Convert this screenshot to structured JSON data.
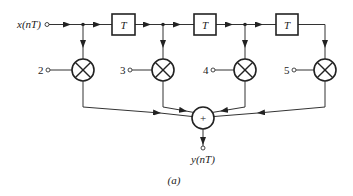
{
  "diagram": {
    "type": "FIR filter block diagram (transversal structure)",
    "input_label": "x(nT)",
    "output_label": "y(nT)",
    "caption": "(a)",
    "delay_label": "T",
    "delays": [
      "T",
      "T",
      "T"
    ],
    "coefficients": [
      "2",
      "3",
      "4",
      "5"
    ],
    "adder_symbol": "+",
    "nodes": [
      {
        "id": "input",
        "label": "x(nT)"
      },
      {
        "id": "delay1",
        "label": "T"
      },
      {
        "id": "delay2",
        "label": "T"
      },
      {
        "id": "delay3",
        "label": "T"
      },
      {
        "id": "mult1",
        "label": "×",
        "coefficient": "2"
      },
      {
        "id": "mult2",
        "label": "×",
        "coefficient": "3"
      },
      {
        "id": "mult3",
        "label": "×",
        "coefficient": "4"
      },
      {
        "id": "mult4",
        "label": "×",
        "coefficient": "5"
      },
      {
        "id": "adder",
        "label": "+"
      },
      {
        "id": "output",
        "label": "y(nT)"
      }
    ],
    "edges": [
      [
        "input",
        "mult1"
      ],
      [
        "input",
        "delay1"
      ],
      [
        "delay1",
        "mult2"
      ],
      [
        "delay1",
        "delay2"
      ],
      [
        "delay2",
        "mult3"
      ],
      [
        "delay2",
        "delay3"
      ],
      [
        "delay3",
        "mult4"
      ],
      [
        "mult1",
        "adder"
      ],
      [
        "mult2",
        "adder"
      ],
      [
        "mult3",
        "adder"
      ],
      [
        "mult4",
        "adder"
      ],
      [
        "adder",
        "output"
      ]
    ]
  }
}
